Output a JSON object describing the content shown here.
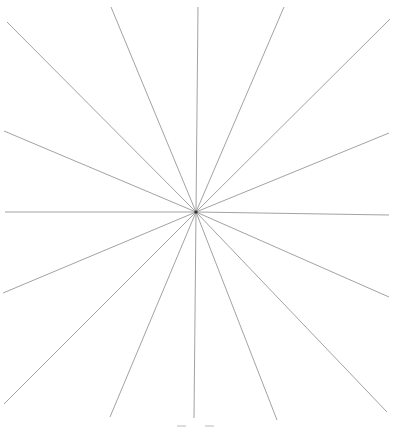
{
  "diagram": {
    "type": "radial-lines",
    "ray_count": 16,
    "colors": {
      "line": "#8a8a8a",
      "hub": "#333333",
      "background": "#ffffff"
    }
  }
}
